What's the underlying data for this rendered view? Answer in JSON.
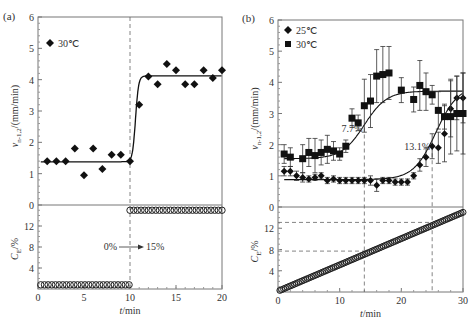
{
  "figure": {
    "panels": [
      {
        "id": "a",
        "label": "(a)"
      },
      {
        "id": "b",
        "label": "(b)"
      }
    ]
  },
  "chart_data": [
    {
      "type": "scatter",
      "panel": "(a)",
      "xlabel": "t/min",
      "x_ticks": [
        0,
        5,
        10,
        15,
        20
      ],
      "xlim": [
        0,
        20
      ],
      "top": {
        "ylabel": "v(n-1,2)/(mm/min)",
        "ylabel_main": "v",
        "ylabel_sub": "n-1,2",
        "ylabel_rest": "/(mm/min)",
        "y_ticks": [
          0,
          1,
          2,
          3,
          4,
          5,
          6
        ],
        "ylim": [
          0,
          6
        ],
        "legend": [
          {
            "marker": "diamond",
            "label": "30℃"
          }
        ],
        "series": [
          {
            "name": "30℃",
            "marker": "diamond",
            "x": [
              1,
              2,
              3,
              4,
              5,
              6,
              7,
              8,
              9,
              10,
              11,
              12,
              13,
              14,
              15,
              16,
              17,
              18,
              19,
              20
            ],
            "y": [
              1.4,
              1.4,
              1.4,
              1.8,
              0.95,
              1.8,
              1.15,
              1.6,
              1.6,
              1.4,
              3.2,
              4.1,
              3.85,
              4.5,
              4.3,
              3.85,
              3.85,
              4.3,
              4.05,
              4.3
            ]
          }
        ],
        "fit_curve": {
          "low": 1.38,
          "high": 4.12,
          "step_at": 10.6
        },
        "vline_x": 10
      },
      "bottom": {
        "ylabel": "C_E/%",
        "ylabel_main": "C",
        "ylabel_sub": "E",
        "ylabel_rest": "/%",
        "y_ticks": [
          4,
          8,
          12
        ],
        "ylim": [
          0,
          16
        ],
        "series": [
          {
            "name": "C_E",
            "marker": "open-circle",
            "segments": [
              {
                "x_from": 0.3,
                "x_to": 9.9,
                "y": 0.8
              },
              {
                "x_from": 10,
                "x_to": 20,
                "y": 15
              }
            ]
          }
        ],
        "annotation": {
          "from": "0%",
          "to": "15%",
          "arrow": "→"
        }
      }
    },
    {
      "type": "scatter",
      "panel": "(b)",
      "xlabel": "t/min",
      "x_ticks": [
        0,
        10,
        20,
        30
      ],
      "xlim": [
        0,
        30
      ],
      "top": {
        "ylabel": "v(n-1,2)/(mm/min)",
        "ylabel_main": "v",
        "ylabel_sub": "n-1,2",
        "ylabel_rest": "/(mm/min)",
        "y_ticks": [
          0,
          1,
          2,
          3,
          4,
          5,
          6
        ],
        "ylim": [
          0,
          6
        ],
        "legend": [
          {
            "marker": "diamond",
            "label": "25℃"
          },
          {
            "marker": "square",
            "label": "30℃"
          }
        ],
        "series": [
          {
            "name": "25℃",
            "marker": "diamond",
            "x": [
              1,
              2,
              3,
              4,
              5,
              6,
              7,
              8,
              9,
              10,
              11,
              12,
              13,
              14,
              15,
              16,
              17,
              18,
              19,
              20,
              21,
              22,
              23,
              24,
              25,
              26,
              27,
              28,
              29,
              30
            ],
            "y": [
              1.15,
              1.15,
              1.0,
              0.95,
              0.9,
              0.95,
              1.0,
              0.85,
              0.9,
              0.85,
              0.85,
              0.85,
              0.85,
              0.85,
              0.85,
              0.7,
              0.85,
              0.85,
              0.8,
              0.8,
              0.8,
              1.0,
              1.35,
              1.6,
              1.95,
              1.9,
              2.35,
              3.15,
              3.5,
              3.5
            ],
            "err": [
              0.15,
              0.15,
              0.15,
              0.15,
              0.1,
              0.1,
              0.1,
              0.1,
              0.1,
              0.1,
              0.1,
              0.1,
              0.1,
              0.1,
              0.15,
              0.2,
              0.1,
              0.1,
              0.1,
              0.1,
              0.1,
              0.1,
              0.2,
              0.3,
              0.4,
              0.5,
              0.9,
              0.9,
              0.7,
              0.8
            ]
          },
          {
            "name": "30℃",
            "marker": "square",
            "x": [
              1,
              2,
              4,
              5,
              6,
              7,
              8,
              9,
              10,
              11,
              12,
              13,
              14,
              15,
              16,
              17,
              18,
              20,
              22,
              23,
              24,
              25,
              26,
              27,
              28,
              29,
              30
            ],
            "y": [
              1.7,
              1.6,
              1.55,
              1.75,
              1.65,
              1.75,
              1.85,
              1.8,
              1.7,
              1.95,
              2.85,
              2.7,
              3.25,
              3.4,
              4.2,
              4.25,
              4.3,
              3.75,
              3.45,
              3.9,
              3.7,
              3.6,
              3.1,
              2.9,
              2.9,
              3.0,
              3.0
            ],
            "err": [
              0.3,
              0.3,
              0.45,
              0.45,
              0.55,
              0.4,
              0.45,
              0.3,
              0.2,
              0.2,
              0.3,
              0.25,
              0.85,
              0.85,
              0.85,
              0.9,
              0.85,
              0.4,
              0.4,
              0.8,
              0.6,
              0.3,
              0.6,
              0.4,
              1.2,
              1.2,
              1.3
            ]
          }
        ],
        "fit_curves": [
          {
            "name": "30℃",
            "low": 1.55,
            "high": 3.72,
            "mid": 14.0,
            "k": 0.55
          },
          {
            "name": "25℃",
            "low": 0.88,
            "high": 3.9,
            "mid": 25.6,
            "k": 0.55
          }
        ],
        "annotations": [
          {
            "text": "7.7%",
            "x": 14,
            "y": 2.55
          },
          {
            "text": "13.1%",
            "x": 25,
            "y": 1.95
          }
        ],
        "vlines_x": [
          14,
          25
        ]
      },
      "bottom": {
        "ylabel": "C_E/%",
        "ylabel_main": "C",
        "ylabel_sub": "E",
        "ylabel_rest": "/%",
        "y_ticks": [
          4,
          8,
          12
        ],
        "ylim": [
          0,
          16
        ],
        "series": [
          {
            "name": "C_E",
            "marker": "open-circle",
            "linear": {
              "x_from": 0.3,
              "y_from": 0.3,
              "x_to": 30,
              "y_to": 15
            }
          }
        ],
        "hlines_y": [
          7.7,
          13.1
        ]
      }
    }
  ]
}
